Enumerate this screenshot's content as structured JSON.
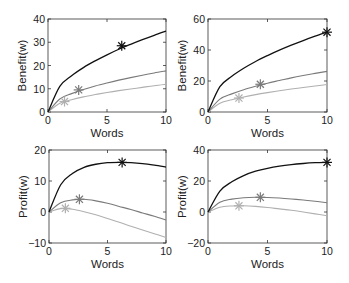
{
  "figure": {
    "layout": "2x2 grid of line plots"
  },
  "chart_data": [
    {
      "type": "line",
      "panel": "top-left",
      "xlabel": "Words",
      "ylabel": "Benefit(w)",
      "xlim": [
        0,
        10
      ],
      "ylim": [
        0,
        40
      ],
      "xticks": [
        0,
        5,
        10
      ],
      "yticks": [
        0,
        10,
        20,
        30,
        40
      ],
      "grid": false,
      "x": [
        0,
        1,
        2,
        3,
        4,
        5,
        6,
        7,
        8,
        9,
        10
      ],
      "series": [
        {
          "name": "dark",
          "color": "#111111",
          "values": [
            0,
            11,
            15.6,
            19.1,
            22,
            24.6,
            27,
            29.1,
            31.1,
            33,
            34.8
          ],
          "marker": {
            "x": 6.25,
            "y": 28.5,
            "symbol": "asterisk"
          }
        },
        {
          "name": "medium",
          "color": "#7a7a7a",
          "values": [
            0,
            5.6,
            7.9,
            9.7,
            11.2,
            12.5,
            13.7,
            14.8,
            15.8,
            16.8,
            17.7
          ],
          "marker": {
            "x": 2.6,
            "y": 9.5,
            "symbol": "asterisk"
          }
        },
        {
          "name": "light",
          "color": "#b0b0b0",
          "values": [
            0,
            3.75,
            5.3,
            6.5,
            7.5,
            8.4,
            9.2,
            9.9,
            10.6,
            11.3,
            11.9
          ],
          "marker": {
            "x": 1.4,
            "y": 4.5,
            "symbol": "asterisk"
          }
        }
      ]
    },
    {
      "type": "line",
      "panel": "top-right",
      "xlabel": "Words",
      "ylabel": "Benefit(w)",
      "xlim": [
        0,
        10
      ],
      "ylim": [
        0,
        60
      ],
      "xticks": [
        0,
        5,
        10
      ],
      "yticks": [
        0,
        20,
        40,
        60
      ],
      "grid": false,
      "x": [
        0,
        1,
        2,
        3,
        4,
        5,
        6,
        7,
        8,
        9,
        10
      ],
      "series": [
        {
          "name": "dark",
          "color": "#111111",
          "values": [
            0,
            16.3,
            23,
            28.2,
            32.6,
            36.4,
            39.9,
            43.1,
            46.1,
            48.9,
            51.5
          ],
          "marker": {
            "x": 10,
            "y": 51.5,
            "symbol": "asterisk"
          }
        },
        {
          "name": "medium",
          "color": "#7a7a7a",
          "values": [
            0,
            8.3,
            11.7,
            14.4,
            16.6,
            18.6,
            20.3,
            22,
            23.5,
            24.9,
            26.2
          ],
          "marker": {
            "x": 4.4,
            "y": 17.9,
            "symbol": "asterisk"
          }
        },
        {
          "name": "light",
          "color": "#b0b0b0",
          "values": [
            0,
            5.6,
            7.9,
            9.7,
            11.2,
            12.5,
            13.7,
            14.8,
            15.8,
            16.8,
            17.7
          ],
          "marker": {
            "x": 2.6,
            "y": 9,
            "symbol": "asterisk"
          }
        }
      ]
    },
    {
      "type": "line",
      "panel": "bottom-left",
      "xlabel": "Words",
      "ylabel": "Profit(w)",
      "xlim": [
        0,
        10
      ],
      "ylim": [
        -10,
        20
      ],
      "xticks": [
        0,
        5,
        10
      ],
      "yticks": [
        -10,
        0,
        10,
        20
      ],
      "grid": false,
      "x": [
        0,
        1,
        2,
        3,
        4,
        5,
        6,
        7,
        8,
        9,
        10
      ],
      "series": [
        {
          "name": "dark",
          "color": "#111111",
          "values": [
            0,
            8.8,
            12.4,
            14.4,
            15.4,
            15.9,
            16,
            15.9,
            15.6,
            15.1,
            14.5
          ],
          "marker": {
            "x": 6.25,
            "y": 16,
            "symbol": "asterisk"
          }
        },
        {
          "name": "medium",
          "color": "#7a7a7a",
          "values": [
            0,
            3,
            3.9,
            4.1,
            3.6,
            2.8,
            1.8,
            0.8,
            -0.3,
            -1.4,
            -2.6
          ],
          "marker": {
            "x": 2.6,
            "y": 4.1,
            "symbol": "asterisk"
          }
        },
        {
          "name": "light",
          "color": "#b0b0b0",
          "values": [
            0,
            1.1,
            0.9,
            0.1,
            -0.9,
            -2.1,
            -3.3,
            -4.6,
            -5.8,
            -7,
            -8.2
          ],
          "marker": {
            "x": 1.4,
            "y": 1.2,
            "symbol": "asterisk"
          }
        }
      ]
    },
    {
      "type": "line",
      "panel": "bottom-right",
      "xlabel": "Words",
      "ylabel": "Profit(w)",
      "xlim": [
        0,
        10
      ],
      "ylim": [
        -20,
        40
      ],
      "xticks": [
        0,
        5,
        10
      ],
      "yticks": [
        -20,
        0,
        20,
        40
      ],
      "grid": false,
      "x": [
        0,
        1,
        2,
        3,
        4,
        5,
        6,
        7,
        8,
        9,
        10
      ],
      "series": [
        {
          "name": "dark",
          "color": "#111111",
          "values": [
            0,
            13.5,
            19.5,
            23.5,
            26.3,
            28.2,
            29.6,
            30.6,
            31.3,
            31.8,
            32.1
          ],
          "marker": {
            "x": 10,
            "y": 32,
            "symbol": "asterisk"
          }
        },
        {
          "name": "medium",
          "color": "#7a7a7a",
          "values": [
            0,
            6.3,
            8.3,
            9.2,
            9.5,
            9.4,
            9,
            8.4,
            7.7,
            6.9,
            6
          ],
          "marker": {
            "x": 4.4,
            "y": 9.5,
            "symbol": "asterisk"
          }
        },
        {
          "name": "light",
          "color": "#b0b0b0",
          "values": [
            0,
            3.1,
            3.9,
            4,
            3.6,
            2.9,
            2,
            1.1,
            0,
            -1.2,
            -2.4
          ],
          "marker": {
            "x": 2.6,
            "y": 4,
            "symbol": "asterisk"
          }
        }
      ]
    }
  ]
}
